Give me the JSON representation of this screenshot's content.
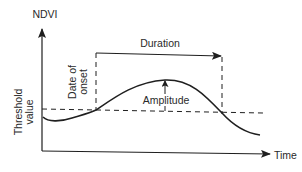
{
  "diagram": {
    "type": "phenology-ndvi-curve",
    "y_axis": {
      "label": "NDVI"
    },
    "x_axis": {
      "label": "Time"
    },
    "annotations": {
      "duration": "Duration",
      "amplitude": "Amplitude",
      "date_of_onset_line1": "Date of",
      "date_of_onset_line2": "onset",
      "threshold_line1": "Threshold",
      "threshold_line2": "value"
    },
    "colors": {
      "line": "#1f1f1f",
      "text": "#2a2a2a",
      "background": "#ffffff"
    }
  }
}
